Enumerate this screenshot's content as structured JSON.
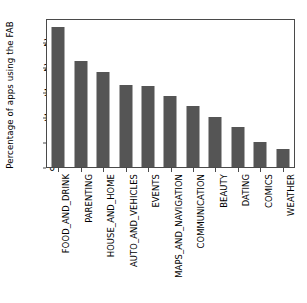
{
  "chart_data": {
    "type": "bar",
    "title": "",
    "xlabel": "",
    "ylabel": "Percentage of apps using the FAB",
    "categories": [
      "FOOD_AND_DRINK",
      "PARENTING",
      "HOUSE_AND_HOME",
      "AUTO_AND_VEHICLES",
      "EVENTS",
      "MAPS_AND_NAVIGATION",
      "COMMUNICATION",
      "BEAUTY",
      "DATING",
      "COMICS",
      "WEATHER"
    ],
    "values": [
      28.0,
      21.2,
      19.0,
      16.4,
      16.2,
      14.2,
      12.2,
      10.0,
      8.0,
      5.0,
      3.6
    ],
    "ylim": [
      0,
      29.6
    ],
    "yticks": [
      0,
      5,
      10,
      15,
      20,
      25
    ],
    "ytick_labels": [
      "0",
      "5",
      "10",
      "15",
      "20",
      "25"
    ],
    "grid": false,
    "legend": null,
    "bar_color": "#555555",
    "axis_color": "#4a4a4a",
    "background": "#ffffff"
  }
}
